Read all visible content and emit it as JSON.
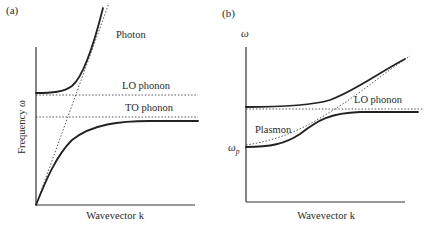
{
  "figure": {
    "panel_a": {
      "tag": "(a)",
      "ylabel": "Frequency ω",
      "xlabel": "Wavevector k",
      "labels": {
        "photon": "Photon",
        "lo_phonon": "LO phonon",
        "to_phonon": "TO phonon"
      }
    },
    "panel_b": {
      "tag": "(b)",
      "ylabel": "ω",
      "xlabel": "Wavevector k",
      "labels": {
        "lo_phonon": "LO phonon",
        "plasmon": "Plasmon",
        "omega_p": "ω",
        "omega_p_sub": "p"
      }
    }
  },
  "colors": {
    "curve": "#222222",
    "axis": "#333333",
    "dotted": "#444444",
    "background": "#ffffff"
  }
}
